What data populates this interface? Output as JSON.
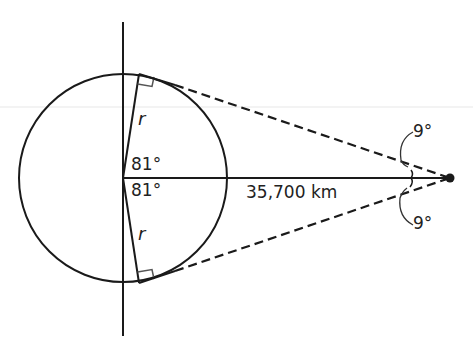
{
  "diagram": {
    "labels": {
      "radius_top": "r",
      "radius_bottom": "r",
      "angle_top": "81°",
      "angle_bottom": "81°",
      "distance": "35,700 km",
      "satellite_angle_top": "9°",
      "satellite_angle_bottom": "9°"
    },
    "colors": {
      "stroke": "#1a1a1a",
      "right_angle_marker": "#555555",
      "faint_guide": "#e6e6e6"
    }
  }
}
